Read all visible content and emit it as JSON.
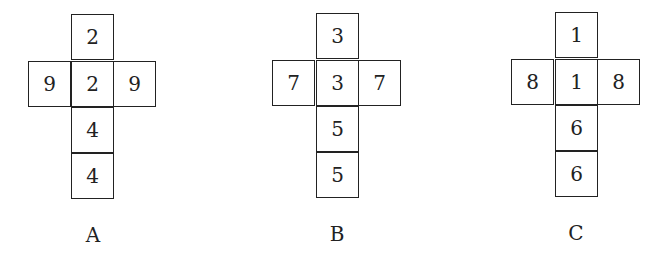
{
  "nets": [
    {
      "label": "A",
      "origin_x": 71,
      "origin_y": 14,
      "cells": {
        "top": "2",
        "left": "9",
        "center": "2",
        "right": "9",
        "bottom1": "4",
        "bottom2": "4"
      }
    },
    {
      "label": "B",
      "origin_x": 316,
      "origin_y": 13,
      "cells": {
        "top": "3",
        "left": "7",
        "center": "3",
        "right": "7",
        "bottom1": "5",
        "bottom2": "5"
      }
    },
    {
      "label": "C",
      "origin_x": 555,
      "origin_y": 12,
      "cells": {
        "top": "1",
        "left": "8",
        "center": "1",
        "right": "8",
        "bottom1": "6",
        "bottom2": "6"
      }
    }
  ]
}
